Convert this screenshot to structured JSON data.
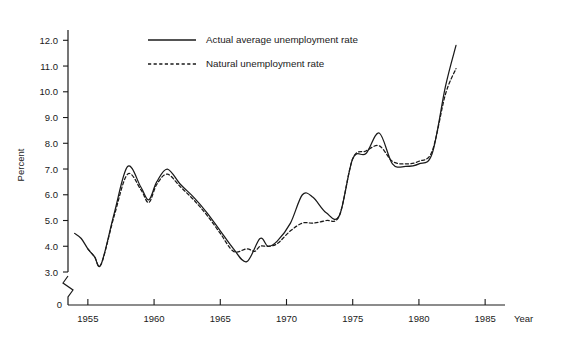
{
  "chart_data": {
    "type": "line",
    "title": "",
    "xlabel": "Year",
    "ylabel": "Percent",
    "xlim": [
      1953.5,
      1986.5
    ],
    "ylim": [
      3.0,
      12.4
    ],
    "yaxis_break": true,
    "yaxis_zero_label": "0",
    "grid": false,
    "legend_position": "top-center",
    "xticks": [
      1955,
      1960,
      1965,
      1970,
      1975,
      1980,
      1985
    ],
    "xtick_labels": [
      "1955",
      "1960",
      "1965",
      "1970",
      "1975",
      "1980",
      "1985"
    ],
    "yticks": [
      3.0,
      4.0,
      5.0,
      6.0,
      7.0,
      8.0,
      9.0,
      10.0,
      11.0,
      12.0
    ],
    "ytick_labels": [
      "3.0",
      "4.0",
      "5.0",
      "6.0",
      "7.0",
      "8.0",
      "9.0",
      "10.0",
      "11.0",
      "12.0"
    ],
    "series": [
      {
        "name": "Actual average unemployment rate",
        "style": "solid",
        "x": [
          1954.0,
          1954.5,
          1955.0,
          1955.5,
          1956.0,
          1957.0,
          1958.0,
          1959.0,
          1959.6,
          1960.2,
          1961.0,
          1962.0,
          1963.0,
          1964.0,
          1965.0,
          1966.0,
          1967.0,
          1968.0,
          1968.6,
          1969.3,
          1970.3,
          1971.2,
          1972.0,
          1973.0,
          1974.0,
          1975.0,
          1976.0,
          1977.0,
          1978.0,
          1979.0,
          1980.0,
          1981.0,
          1982.0,
          1982.8
        ],
        "y": [
          4.5,
          4.3,
          3.9,
          3.6,
          3.3,
          5.3,
          7.1,
          6.3,
          5.8,
          6.5,
          7.0,
          6.4,
          5.9,
          5.3,
          4.6,
          3.9,
          3.4,
          4.3,
          4.0,
          4.2,
          4.9,
          6.0,
          5.9,
          5.3,
          5.2,
          7.4,
          7.6,
          8.4,
          7.2,
          7.1,
          7.2,
          7.6,
          10.2,
          11.8
        ]
      },
      {
        "name": "Natural unemployment rate",
        "style": "dashed",
        "x": [
          1955.0,
          1955.5,
          1956.0,
          1957.0,
          1958.0,
          1959.0,
          1959.6,
          1960.2,
          1961.0,
          1962.0,
          1963.0,
          1964.0,
          1965.0,
          1966.0,
          1967.0,
          1967.6,
          1968.0,
          1968.6,
          1969.3,
          1970.3,
          1971.2,
          1972.0,
          1973.0,
          1974.0,
          1975.0,
          1976.0,
          1977.0,
          1978.0,
          1979.0,
          1980.0,
          1981.0,
          1982.0,
          1982.8
        ],
        "y": [
          3.9,
          3.6,
          3.3,
          5.2,
          6.8,
          6.2,
          5.7,
          6.4,
          6.8,
          6.3,
          5.8,
          5.2,
          4.5,
          3.8,
          3.9,
          3.8,
          4.0,
          4.0,
          4.1,
          4.6,
          4.9,
          4.9,
          5.0,
          5.2,
          7.4,
          7.7,
          7.9,
          7.3,
          7.2,
          7.3,
          7.7,
          9.9,
          10.9
        ]
      }
    ],
    "legend": [
      {
        "label": "Actual average unemployment rate",
        "style": "solid"
      },
      {
        "label": "Natural unemployment rate",
        "style": "dashed"
      }
    ]
  }
}
